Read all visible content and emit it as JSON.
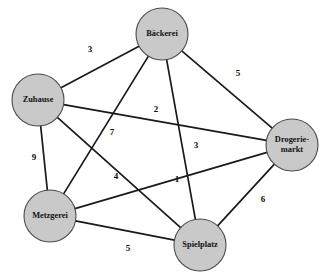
{
  "diagram": {
    "type": "weighted-undirected-graph",
    "title": "",
    "node_fill_color": "#c9c9c9",
    "node_stroke_color": "#4a4a4a",
    "edge_color": "#1a1a1a",
    "background_color": "#ffffff",
    "nodes": [
      {
        "id": "zuhause",
        "label": "Zuhause",
        "label_lines": [
          "Zuhause"
        ],
        "cx": 38,
        "cy": 100,
        "r": 26
      },
      {
        "id": "baeckerei",
        "label": "Bäckerei",
        "label_lines": [
          "Bäckerei"
        ],
        "cx": 162,
        "cy": 34,
        "r": 26
      },
      {
        "id": "drogeriemarkt",
        "label": "Drogerie-markt",
        "label_lines": [
          "Drogerie-",
          "markt"
        ],
        "cx": 292,
        "cy": 145,
        "r": 26
      },
      {
        "id": "metzgerei",
        "label": "Metzgerei",
        "label_lines": [
          "Metzgerei"
        ],
        "cx": 50,
        "cy": 216,
        "r": 26
      },
      {
        "id": "spielplatz",
        "label": "Spielplatz",
        "label_lines": [
          "Spielplatz"
        ],
        "cx": 200,
        "cy": 245,
        "r": 26
      }
    ],
    "edges": [
      {
        "id": "zuhause-baeckerei",
        "source": "zuhause",
        "target": "baeckerei",
        "weight": "3",
        "label_x": 90,
        "label_y": 50
      },
      {
        "id": "baeckerei-drogeriemarkt",
        "source": "baeckerei",
        "target": "drogeriemarkt",
        "weight": "5",
        "label_x": 238,
        "label_y": 74
      },
      {
        "id": "zuhause-drogeriemarkt",
        "source": "zuhause",
        "target": "drogeriemarkt",
        "weight": "2",
        "label_x": 156,
        "label_y": 110
      },
      {
        "id": "baeckerei-metzgerei",
        "source": "baeckerei",
        "target": "metzgerei",
        "weight": "7",
        "label_x": 112,
        "label_y": 133
      },
      {
        "id": "baeckerei-spielplatz",
        "source": "baeckerei",
        "target": "spielplatz",
        "weight": "3",
        "label_x": 196,
        "label_y": 146
      },
      {
        "id": "zuhause-metzgerei",
        "source": "zuhause",
        "target": "metzgerei",
        "weight": "9",
        "label_x": 34,
        "label_y": 158
      },
      {
        "id": "zuhause-spielplatz",
        "source": "zuhause",
        "target": "spielplatz",
        "weight": "4",
        "label_x": 116,
        "label_y": 177
      },
      {
        "id": "metzgerei-drogeriemarkt",
        "source": "metzgerei",
        "target": "drogeriemarkt",
        "weight": "1",
        "label_x": 177,
        "label_y": 180
      },
      {
        "id": "drogeriemarkt-spielplatz",
        "source": "drogeriemarkt",
        "target": "spielplatz",
        "weight": "6",
        "label_x": 263,
        "label_y": 200
      },
      {
        "id": "metzgerei-spielplatz",
        "source": "metzgerei",
        "target": "spielplatz",
        "weight": "5",
        "label_x": 128,
        "label_y": 249
      }
    ]
  }
}
